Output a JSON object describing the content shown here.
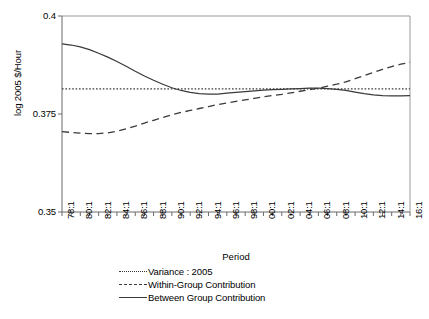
{
  "chart_data": {
    "type": "line",
    "title": "",
    "xlabel": "Period",
    "ylabel": "log 2005 $/Hour",
    "ylim": [
      0.35,
      0.4
    ],
    "yticks": [
      "0.4",
      "0.375",
      "0.35"
    ],
    "ytick_values": [
      0.4,
      0.375,
      0.35
    ],
    "grid": false,
    "legend_position": "bottom",
    "x": [
      "78:1",
      "79:1",
      "80:1",
      "81:1",
      "82:1",
      "83:1",
      "84:1",
      "85:1",
      "86:1",
      "87:1",
      "88:1",
      "89:1",
      "90:1",
      "91:1",
      "92:1",
      "93:1",
      "94:1",
      "95:1",
      "96:1",
      "97:1",
      "98:1",
      "99:1",
      "00:1",
      "01:1",
      "02:1",
      "03:1",
      "04:1",
      "05:1",
      "06:1",
      "07:1",
      "08:1",
      "09:1",
      "10:1",
      "11:1",
      "12:1",
      "13:1",
      "14:1",
      "15:1",
      "16:1"
    ],
    "xtick_labels": [
      "78:1",
      "80:1",
      "82:1",
      "84:1",
      "86:1",
      "88:1",
      "90:1",
      "92:1",
      "94:1",
      "96:1",
      "98:1",
      "00:1",
      "02:1",
      "04:1",
      "06:1",
      "08:1",
      "10:1",
      "12:1",
      "14:1",
      "16:1"
    ],
    "series": [
      {
        "name": "Variance : 2005",
        "style": "dotted",
        "color": "#3a3a3a",
        "constant": 0.3814,
        "values": [
          0.3814,
          0.3814,
          0.3814,
          0.3814,
          0.3814,
          0.3814,
          0.3814,
          0.3814,
          0.3814,
          0.3814,
          0.3814,
          0.3814,
          0.3814,
          0.3814,
          0.3814,
          0.3814,
          0.3814,
          0.3814,
          0.3814,
          0.3814,
          0.3814,
          0.3814,
          0.3814,
          0.3814,
          0.3814,
          0.3814,
          0.3814,
          0.3814,
          0.3814,
          0.3814,
          0.3814,
          0.3814,
          0.3814,
          0.3814,
          0.3814,
          0.3814,
          0.3814,
          0.3814,
          0.3814
        ]
      },
      {
        "name": "Within-Group Contribution",
        "style": "dashed",
        "color": "#3a3a3a",
        "values": [
          0.3705,
          0.3703,
          0.3701,
          0.37,
          0.37,
          0.3702,
          0.3706,
          0.3712,
          0.3719,
          0.3727,
          0.3734,
          0.3741,
          0.3748,
          0.3754,
          0.3759,
          0.3764,
          0.3769,
          0.3774,
          0.3778,
          0.3782,
          0.3786,
          0.379,
          0.3794,
          0.3797,
          0.38,
          0.3804,
          0.3808,
          0.3812,
          0.3816,
          0.3821,
          0.3826,
          0.3832,
          0.384,
          0.3848,
          0.3856,
          0.3864,
          0.3871,
          0.3877,
          0.3882
        ]
      },
      {
        "name": "Between Group Contribution",
        "style": "solid",
        "color": "#3a3a3a",
        "values": [
          0.3929,
          0.3926,
          0.3921,
          0.3914,
          0.3905,
          0.3895,
          0.3884,
          0.3872,
          0.3859,
          0.3847,
          0.3836,
          0.3826,
          0.3817,
          0.381,
          0.3805,
          0.3802,
          0.3801,
          0.3801,
          0.3803,
          0.3805,
          0.3807,
          0.3809,
          0.3811,
          0.3812,
          0.3813,
          0.3814,
          0.3815,
          0.3816,
          0.3816,
          0.3815,
          0.3813,
          0.381,
          0.3806,
          0.3802,
          0.3799,
          0.3797,
          0.3796,
          0.3796,
          0.3797
        ]
      }
    ]
  },
  "axes": {
    "y_title": "log 2005 $/Hour",
    "x_title": "Period"
  },
  "legend": {
    "items": [
      {
        "label": "Variance : 2005",
        "style": "dotted"
      },
      {
        "label": "Within-Group Contribution",
        "style": "dashed"
      },
      {
        "label": "Between Group Contribution",
        "style": "solid"
      }
    ]
  }
}
